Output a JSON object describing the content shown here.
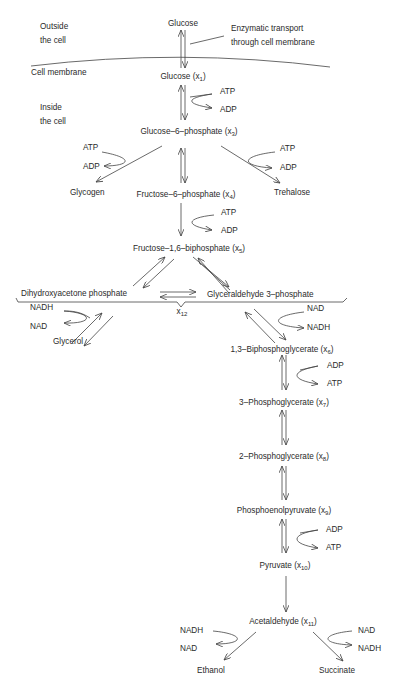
{
  "diagram": {
    "regions": {
      "outside": "Outside",
      "outside2": "the cell",
      "inside": "Inside",
      "inside2": "the cell",
      "membrane": "Cell membrane",
      "transport1": "Enzymatic transport",
      "transport2": "through cell membrane"
    },
    "nodes": {
      "glucose_out": "Glucose",
      "x1": {
        "name": "Glucose (x",
        "sub": "1",
        "close": ")"
      },
      "x3": {
        "name": "Glucose–6–phosphate (x",
        "sub": "3",
        "close": ")"
      },
      "glycogen": "Glycogen",
      "trehalose": "Trehalose",
      "x4": {
        "name": "Fructose–6–phosphate (x",
        "sub": "4",
        "close": ")"
      },
      "x5": {
        "name": "Fructose–1,6–biphosphate (x",
        "sub": "5",
        "close": ")"
      },
      "dhap": "Dihydroxyacetone phosphate",
      "gap": "Glyceraldehyde 3–phosphate",
      "x12": {
        "name": "x",
        "sub": "12"
      },
      "glycerol": "Glycerol",
      "x6": {
        "name": "1,3–Biphosphoglycerate (x",
        "sub": "6",
        "close": ")"
      },
      "x7": {
        "name": "3–Phosphoglycerate (x",
        "sub": "7",
        "close": ")"
      },
      "x8": {
        "name": "2–Phosphoglycerate (x",
        "sub": "8",
        "close": ")"
      },
      "x9": {
        "name": "Phosphoenolpyruvate (x",
        "sub": "9",
        "close": ")"
      },
      "x10": {
        "name": "Pyruvate (x",
        "sub": "10",
        "close": ")"
      },
      "x11": {
        "name": "Acetaldehyde (x",
        "sub": "11",
        "close": ")"
      },
      "ethanol": "Ethanol",
      "succinate": "Succinate"
    },
    "cofactors": {
      "c1_top": "ATP",
      "c1_bot": "ADP",
      "c2_top": "ATP",
      "c2_bot": "ADP",
      "c3_top": "ATP",
      "c3_bot": "ADP",
      "c4_top": "ATP",
      "c4_bot": "ADP",
      "c5_top": "NADH",
      "c5_bot": "NAD",
      "c6_top": "NAD",
      "c6_bot": "NADH",
      "c7_top": "ADP",
      "c7_bot": "ATP",
      "c8_top": "ADP",
      "c8_bot": "ATP",
      "c9_top": "NADH",
      "c9_bot": "NAD",
      "c10_top": "NAD",
      "c10_bot": "NADH"
    }
  }
}
